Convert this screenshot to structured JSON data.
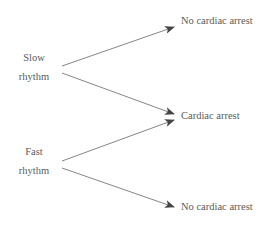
{
  "diagram": {
    "type": "tree",
    "nodes": {
      "slow": {
        "line1": "Slow",
        "line2": "rhythm"
      },
      "fast": {
        "line1": "Fast",
        "line2": "rhythm"
      },
      "outcome_top": "No cardiac arrest",
      "outcome_mid": "Cardiac arrest",
      "outcome_bottom": "No cardiac arrest"
    },
    "edges": [
      {
        "from": "Slow rhythm",
        "to": "No cardiac arrest"
      },
      {
        "from": "Slow rhythm",
        "to": "Cardiac arrest"
      },
      {
        "from": "Fast rhythm",
        "to": "Cardiac arrest"
      },
      {
        "from": "Fast rhythm",
        "to": "No cardiac arrest"
      }
    ],
    "colors": {
      "arrow": "#555555",
      "text": "#5a5a5a"
    }
  }
}
